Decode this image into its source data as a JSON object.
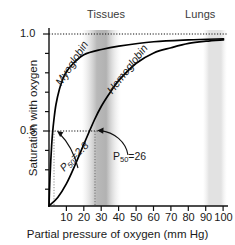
{
  "chart_data": {
    "type": "line",
    "title": "",
    "xlabel": "Partial pressure of oxygen (mm Hg)",
    "ylabel": "Saturation with oxygen",
    "xlim": [
      0,
      102
    ],
    "ylim": [
      0,
      1.06
    ],
    "grid": false,
    "legend_position": "inline-curve-labels",
    "xticks": [
      10,
      20,
      30,
      40,
      50,
      60,
      70,
      80,
      90,
      100
    ],
    "xtick_labels": [
      "10",
      "20",
      "30",
      "40",
      "50",
      "60",
      "70",
      "80",
      "90",
      "100"
    ],
    "yticks": [
      0.5,
      1.0
    ],
    "ytick_labels": [
      "0.5",
      "1.0"
    ],
    "yminor_ticks": [
      0.1,
      0.2,
      0.3,
      0.4,
      0.6,
      0.7,
      0.8,
      0.9
    ],
    "series": [
      {
        "name": "Myoglobin",
        "label": "Myoglobin",
        "model": "hyperbolic",
        "p50": 2.8,
        "hill_n": 1.0,
        "color": "#000000",
        "points": [
          {
            "x": 0,
            "y": 0.0
          },
          {
            "x": 0.5,
            "y": 0.15
          },
          {
            "x": 1.0,
            "y": 0.26
          },
          {
            "x": 1.5,
            "y": 0.35
          },
          {
            "x": 2.0,
            "y": 0.42
          },
          {
            "x": 2.8,
            "y": 0.5
          },
          {
            "x": 4.0,
            "y": 0.59
          },
          {
            "x": 6.0,
            "y": 0.68
          },
          {
            "x": 8.0,
            "y": 0.74
          },
          {
            "x": 10.0,
            "y": 0.78
          },
          {
            "x": 14.0,
            "y": 0.83
          },
          {
            "x": 20.0,
            "y": 0.88
          },
          {
            "x": 30.0,
            "y": 0.91
          },
          {
            "x": 40.0,
            "y": 0.93
          },
          {
            "x": 60.0,
            "y": 0.955
          },
          {
            "x": 80.0,
            "y": 0.966
          },
          {
            "x": 100.0,
            "y": 0.972
          }
        ]
      },
      {
        "name": "Hemoglobin",
        "label": "Hemoglobin",
        "model": "sigmoidal",
        "p50": 26,
        "hill_n": 2.8,
        "color": "#000000",
        "points": [
          {
            "x": 0,
            "y": 0.0
          },
          {
            "x": 5,
            "y": 0.05
          },
          {
            "x": 10,
            "y": 0.13
          },
          {
            "x": 15,
            "y": 0.24
          },
          {
            "x": 20,
            "y": 0.36
          },
          {
            "x": 26,
            "y": 0.5
          },
          {
            "x": 30,
            "y": 0.58
          },
          {
            "x": 35,
            "y": 0.66
          },
          {
            "x": 40,
            "y": 0.73
          },
          {
            "x": 50,
            "y": 0.83
          },
          {
            "x": 60,
            "y": 0.89
          },
          {
            "x": 70,
            "y": 0.92
          },
          {
            "x": 80,
            "y": 0.945
          },
          {
            "x": 90,
            "y": 0.958
          },
          {
            "x": 100,
            "y": 0.966
          }
        ]
      }
    ],
    "bands": [
      {
        "name": "Tissues",
        "label": "Tissues",
        "x_start": 19,
        "x_end": 40,
        "style": "gradient-dark"
      },
      {
        "name": "Lungs",
        "label": "Lungs",
        "x_start": 88,
        "x_end": 101,
        "style": "gradient-light"
      }
    ],
    "annotations": [
      {
        "name": "p50-myoglobin",
        "text_prefix": "P",
        "text_sub": "50",
        "text_suffix": "=2.8",
        "full_text": "P50=2.8",
        "value": 2.8,
        "target_x": 2.8,
        "target_y": 0.5
      },
      {
        "name": "p50-hemoglobin",
        "text_prefix": "P",
        "text_sub": "50",
        "text_suffix": "=26",
        "full_text": "P50=26",
        "value": 26,
        "target_x": 26,
        "target_y": 0.5
      }
    ],
    "reference_lines": [
      {
        "name": "saturation-1.0",
        "orientation": "horizontal",
        "value": 1.0,
        "style": "dotted"
      },
      {
        "name": "saturation-0.5",
        "orientation": "horizontal",
        "value": 0.5,
        "style": "dotted",
        "x_end": 26
      },
      {
        "name": "p50-myoglobin-vline",
        "orientation": "vertical",
        "value": 2.8,
        "style": "dotted"
      },
      {
        "name": "p50-hemoglobin-vline",
        "orientation": "vertical",
        "value": 26,
        "style": "dotted"
      }
    ]
  }
}
